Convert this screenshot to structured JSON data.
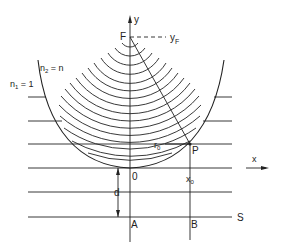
{
  "diagram": {
    "labels": {
      "y_axis": "y",
      "x_axis": "x",
      "focus": "F",
      "focus_height": "y",
      "focus_height_sub": "F",
      "medium_outer": "n",
      "medium_outer_sub": "1",
      "medium_outer_value": " = 1",
      "medium_inner": "n",
      "medium_inner_sub": "2",
      "medium_inner_value": " = n",
      "origin": "0",
      "point": "P",
      "radius": "r",
      "radius_sub": "0",
      "x0": "x",
      "x0_sub": "0",
      "distance": "d",
      "point_a": "A",
      "point_b": "B",
      "screen": "S"
    },
    "colors": {
      "line": "#222222",
      "background": "#ffffff"
    },
    "horizontal_wavefronts": 6,
    "circular_wavefronts": 16
  }
}
